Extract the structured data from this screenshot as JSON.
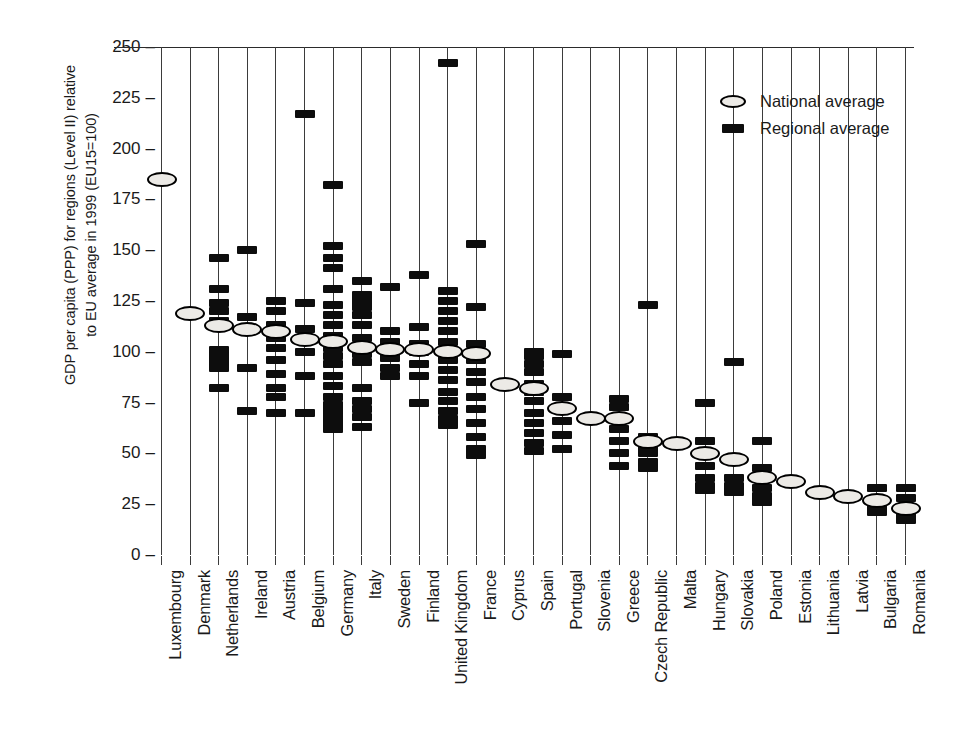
{
  "chart_data": {
    "type": "scatter",
    "title": "",
    "xlabel": "",
    "ylabel": "GDP per capita (PPP) for regions (Level II) relative to EU average in 1999 (EU15=100)",
    "ylabel_lines": [
      "GDP per capita (PPP) for regions (Level II) relative",
      "to EU average in 1999 (EU15=100)"
    ],
    "ylim": [
      0,
      250
    ],
    "yticks": [
      0,
      25,
      50,
      75,
      100,
      125,
      150,
      175,
      200,
      225,
      250
    ],
    "grid": "vertical-per-category",
    "reference_line": 100,
    "legend_position": "top-right",
    "legend": [
      {
        "key": "national-average-oval",
        "label": "National average"
      },
      {
        "key": "regional-average-bar",
        "label": "Regional average"
      }
    ],
    "categories": [
      "Luxembourg",
      "Denmark",
      "Netherlands",
      "Ireland",
      "Austria",
      "Belgium",
      "Germany",
      "Italy",
      "Sweden",
      "Finland",
      "United Kingdom",
      "France",
      "Cyprus",
      "Spain",
      "Portugal",
      "Slovenia",
      "Greece",
      "Czech Republic",
      "Malta",
      "Hungary",
      "Slovakia",
      "Poland",
      "Estonia",
      "Lithuania",
      "Latvia",
      "Bulgaria",
      "Romania"
    ],
    "series": [
      {
        "name": "National average",
        "marker": "oval",
        "values": [
          185,
          119,
          113,
          111,
          110,
          106,
          105,
          102,
          101,
          101,
          100,
          99,
          84,
          82,
          72,
          67,
          67,
          56,
          55,
          50,
          47,
          38,
          36,
          31,
          29,
          27,
          23
        ]
      },
      {
        "name": "Regional average",
        "marker": "bar",
        "values_by_category": {
          "Luxembourg": [
            185
          ],
          "Denmark": [
            119
          ],
          "Netherlands": [
            146,
            131,
            124,
            120,
            115,
            113,
            101,
            98,
            95,
            92,
            82
          ],
          "Ireland": [
            150,
            117,
            111,
            92,
            71
          ],
          "Austria": [
            125,
            120,
            113,
            110,
            107,
            102,
            96,
            89,
            82,
            78,
            70
          ],
          "Belgium": [
            217,
            124,
            111,
            106,
            100,
            88,
            70
          ],
          "Germany": [
            182,
            152,
            146,
            141,
            131,
            123,
            118,
            113,
            108,
            105,
            102,
            98,
            94,
            88,
            83,
            78,
            74,
            71,
            68,
            65,
            62
          ],
          "Italy": [
            135,
            128,
            125,
            122,
            118,
            113,
            107,
            102,
            99,
            95,
            82,
            76,
            72,
            68,
            63
          ],
          "Sweden": [
            132,
            110,
            105,
            101,
            97,
            92,
            88
          ],
          "Finland": [
            138,
            112,
            104,
            100,
            94,
            88,
            75
          ],
          "United Kingdom": [
            242,
            130,
            125,
            120,
            115,
            110,
            105,
            100,
            96,
            91,
            86,
            80,
            76,
            71,
            67,
            64
          ],
          "France": [
            153,
            122,
            104,
            100,
            96,
            90,
            85,
            78,
            72,
            65,
            58,
            52,
            49
          ],
          "Cyprus": [
            84
          ],
          "Spain": [
            100,
            98,
            94,
            90,
            84,
            80,
            76,
            70,
            65,
            60,
            55,
            51
          ],
          "Portugal": [
            99,
            78,
            72,
            66,
            59,
            52
          ],
          "Slovenia": [
            67
          ],
          "Greece": [
            77,
            73,
            68,
            62,
            56,
            50,
            44
          ],
          "Czech Republic": [
            123,
            58,
            53,
            50,
            46,
            43
          ],
          "Malta": [
            55
          ],
          "Hungary": [
            75,
            56,
            44,
            38,
            34,
            32
          ],
          "Slovakia": [
            95,
            47,
            38,
            34,
            31
          ],
          "Poland": [
            56,
            43,
            38,
            33,
            29,
            26
          ],
          "Estonia": [
            36
          ],
          "Lithuania": [
            31
          ],
          "Latvia": [
            29
          ],
          "Bulgaria": [
            33,
            27,
            24,
            21
          ],
          "Romania": [
            33,
            28,
            23,
            20,
            17
          ]
        }
      }
    ]
  },
  "axis": {
    "y_tick_labels": [
      "250",
      "225",
      "200",
      "175",
      "150",
      "125",
      "100",
      "75",
      "50",
      "25",
      "0"
    ],
    "tick_dash": "–"
  },
  "colors": {
    "marker_fill": "#0d0d0d",
    "oval_fill": "#eceae6",
    "axis": "#3b3b3b",
    "background": "#ffffff"
  }
}
